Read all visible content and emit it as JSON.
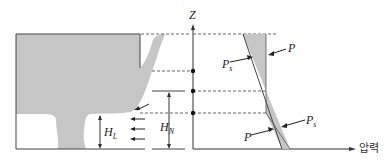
{
  "diagram": {
    "axis": {
      "vertical_label": "Z",
      "horizontal_label": "압력"
    },
    "left_labels": {
      "hl": {
        "main": "H",
        "sub": "L"
      },
      "hn": {
        "main": "H",
        "sub": "N"
      }
    },
    "right_labels": {
      "p_top": "P",
      "ps_top": {
        "main": "P",
        "sub": "s"
      },
      "p_bottom": "P",
      "ps_bottom": {
        "main": "P",
        "sub": "s"
      }
    },
    "colors": {
      "fill": "#c8c8c8",
      "line": "#333333",
      "dashed": "#666666"
    }
  }
}
